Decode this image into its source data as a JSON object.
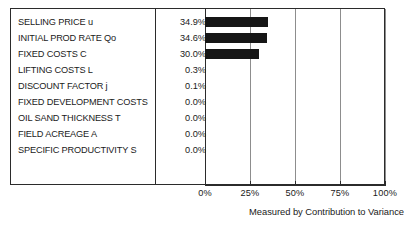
{
  "chart_data": {
    "type": "bar",
    "orientation": "horizontal",
    "title": "",
    "subtitle": "",
    "xlabel": "Measured by Contribution to Variance",
    "ylabel": "",
    "xlim": [
      0,
      100
    ],
    "grid": true,
    "legend": null,
    "xticks": [
      "0%",
      "25%",
      "50%",
      "75%",
      "100%"
    ],
    "xtick_values": [
      0,
      25,
      50,
      75,
      100
    ],
    "categories": [
      "SELLING PRICE u",
      "INITIAL PROD RATE Qo",
      "FIXED COSTS C",
      "LIFTING COSTS L",
      "DISCOUNT FACTOR j",
      "FIXED DEVELOPMENT COSTS",
      "OIL SAND THICKNESS T",
      "FIELD ACREAGE A",
      "SPECIFIC PRODUCTIVITY S"
    ],
    "values": [
      34.9,
      34.6,
      30.0,
      0.3,
      0.1,
      0.0,
      0.0,
      0.0,
      0.0
    ],
    "value_labels": [
      "34.9%",
      "34.6%",
      "30.0%",
      "0.3%",
      "0.1%",
      "0.0%",
      "0.0%",
      "0.0%",
      "0.0%"
    ],
    "bar_color": "#161616",
    "axis_color": "#2b2b2b",
    "grid_color": "#8d8d8d"
  },
  "rows": [
    {
      "label": "SELLING PRICE u",
      "value": "34.9%",
      "pct": 34.9
    },
    {
      "label": "INITIAL PROD RATE Qo",
      "value": "34.6%",
      "pct": 34.6
    },
    {
      "label": "FIXED COSTS C",
      "value": "30.0%",
      "pct": 30.0
    },
    {
      "label": "LIFTING COSTS L",
      "value": "0.3%",
      "pct": 0.3
    },
    {
      "label": "DISCOUNT FACTOR j",
      "value": "0.1%",
      "pct": 0.1
    },
    {
      "label": "FIXED DEVELOPMENT COSTS",
      "value": "0.0%",
      "pct": 0.0
    },
    {
      "label": "OIL SAND THICKNESS T",
      "value": "0.0%",
      "pct": 0.0
    },
    {
      "label": "FIELD ACREAGE A",
      "value": "0.0%",
      "pct": 0.0
    },
    {
      "label": "SPECIFIC PRODUCTIVITY S",
      "value": "0.0%",
      "pct": 0.0
    }
  ],
  "axis": {
    "ticks": [
      "0%",
      "25%",
      "50%",
      "75%",
      "100%"
    ]
  },
  "caption": {
    "text": "Measured by Contribution to Variance"
  }
}
